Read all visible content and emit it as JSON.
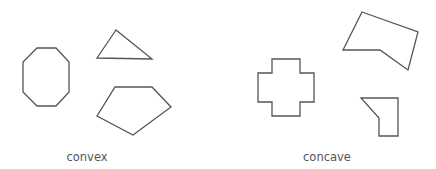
{
  "diagram": {
    "groups": [
      {
        "label": "convex",
        "shapes": [
          {
            "name": "octagon"
          },
          {
            "name": "triangle"
          },
          {
            "name": "pentagon"
          }
        ]
      },
      {
        "label": "concave",
        "shapes": [
          {
            "name": "cross"
          },
          {
            "name": "concave-pentagon"
          },
          {
            "name": "concave-quadrilateral"
          }
        ]
      }
    ],
    "stroke_color": "#555555",
    "background_color": "#ffffff"
  }
}
